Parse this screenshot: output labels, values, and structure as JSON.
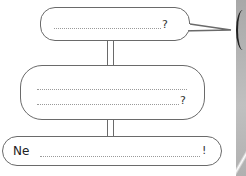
{
  "worksheet": {
    "bubble1": {
      "line_placeholder": "",
      "end_punct": "?"
    },
    "bubble2": {
      "line1_placeholder": "",
      "line2_placeholder": "",
      "end_punct": "?"
    },
    "bubble3": {
      "prefix": "Ne",
      "line_placeholder": "",
      "end_punct": "!"
    }
  },
  "colors": {
    "outline": "#6a6a6a",
    "dots": "#9a9a9a",
    "photo_strip": "#b0b0b0"
  }
}
